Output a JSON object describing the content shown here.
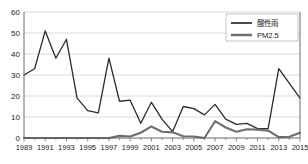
{
  "chart_data": {
    "type": "line",
    "title": "",
    "xlabel": "",
    "ylabel": "",
    "xlim": [
      1989,
      2015
    ],
    "ylim": [
      0,
      60
    ],
    "grid": true,
    "legend_position": "top-right",
    "ytick_labels": [
      "0",
      "10",
      "20",
      "30",
      "40",
      "50",
      "60"
    ],
    "ytick_values": [
      0,
      10,
      20,
      30,
      40,
      50,
      60
    ],
    "xtick_labels": [
      "1989",
      "1991",
      "1993",
      "1995",
      "1997",
      "1999",
      "2001",
      "2003",
      "2005",
      "2007",
      "2009",
      "2011",
      "2013",
      "2015"
    ],
    "xtick_values": [
      1989,
      1991,
      1993,
      1995,
      1997,
      1999,
      2001,
      2003,
      2005,
      2007,
      2009,
      2011,
      2013,
      2015
    ],
    "x": [
      1989,
      1990,
      1991,
      1992,
      1993,
      1994,
      1995,
      1996,
      1997,
      1998,
      1999,
      2000,
      2001,
      2002,
      2003,
      2004,
      2005,
      2006,
      2007,
      2008,
      2009,
      2010,
      2011,
      2012,
      2013,
      2014,
      2015
    ],
    "series": [
      {
        "name": "酸性雨",
        "color": "#2b2b2b",
        "width": 1.3,
        "values": [
          30,
          33,
          51,
          38,
          47,
          19,
          13,
          12,
          38,
          17.5,
          18,
          7,
          17,
          9,
          3,
          15,
          14,
          11,
          16,
          9,
          6.5,
          7,
          4.5,
          4.5,
          33,
          26,
          19
        ]
      },
      {
        "name": "PM2.5",
        "color": "#6e6e6e",
        "width": 2.1,
        "values": [
          0,
          0,
          0,
          0,
          0,
          0,
          0,
          0,
          0,
          1,
          0.7,
          2.5,
          5.5,
          3,
          2.7,
          0.8,
          0.7,
          0,
          8,
          5,
          3,
          4.2,
          4,
          3.5,
          0.4,
          0.6,
          2.5
        ]
      }
    ]
  },
  "legend": {
    "entries": [
      {
        "label": "酸性雨"
      },
      {
        "label": "PM2.5"
      }
    ]
  }
}
